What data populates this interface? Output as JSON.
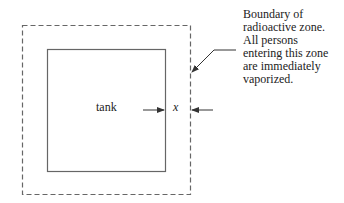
{
  "diagram": {
    "tank_label": "tank",
    "gap_label": "x",
    "callout_lines": [
      "Boundary of",
      "radioactive zone.",
      "All persons",
      "entering this zone",
      "are immediately",
      "vaporized."
    ],
    "shapes": {
      "outer_boundary": {
        "style": "dashed",
        "x": 22,
        "y": 25,
        "width": 168,
        "height": 169
      },
      "inner_tank": {
        "style": "solid",
        "x": 47,
        "y": 49,
        "width": 118,
        "height": 122
      }
    },
    "colors": {
      "stroke": "#666666",
      "text": "#222222",
      "background": "#ffffff"
    }
  }
}
